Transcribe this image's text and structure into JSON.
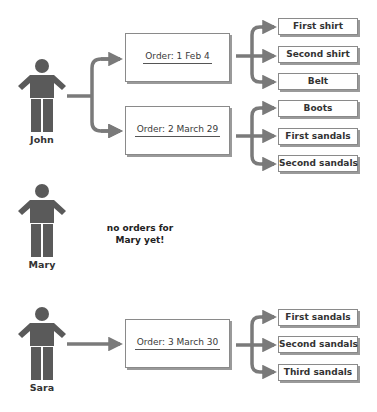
{
  "diagram": {
    "colors": {
      "figure": "#5a5a5a",
      "connector": "#7a7a7a",
      "box_border": "#8a8a8a",
      "box_shadow": "#9a9a9a",
      "text": "#333333"
    },
    "customers": [
      {
        "name": "John",
        "icon": "person-icon",
        "orders": [
          {
            "label": "Order: 1  Feb 4",
            "items": [
              "First shirt",
              "Second shirt",
              "Belt"
            ]
          },
          {
            "label": "Order: 2  March 29",
            "items": [
              "Boots",
              "First sandals",
              "Second sandals"
            ]
          }
        ]
      },
      {
        "name": "Mary",
        "icon": "person-icon",
        "note_line1": "no orders for",
        "note_line2": "Mary yet!",
        "orders": []
      },
      {
        "name": "Sara",
        "icon": "person-icon",
        "orders": [
          {
            "label": "Order: 3  March 30",
            "items": [
              "First sandals",
              "Second sandals",
              "Third sandals"
            ]
          }
        ]
      }
    ]
  }
}
